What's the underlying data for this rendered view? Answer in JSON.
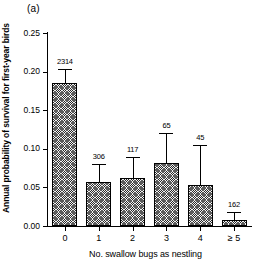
{
  "figure": {
    "panel_label": "(a)",
    "background_color": "#ffffff",
    "bar_fill_color": "#f2f2f2",
    "line_color": "#000000"
  },
  "chart_data": {
    "type": "bar",
    "title": "(a)",
    "xlabel": "No. swallow bugs as nestling",
    "ylabel": "Annual probability of survival for first-year birds",
    "categories": [
      "0",
      "1",
      "2",
      "3",
      "4",
      "≥ 5"
    ],
    "values": [
      0.185,
      0.057,
      0.062,
      0.082,
      0.053,
      0.008
    ],
    "errors_upper": [
      0.204,
      0.08,
      0.089,
      0.12,
      0.105,
      0.018
    ],
    "point_labels": [
      "2314",
      "306",
      "117",
      "65",
      "45",
      "162"
    ],
    "ylim": [
      0.0,
      0.25
    ],
    "ytick_labels": [
      "0.00",
      "0.05",
      "0.10",
      "0.15",
      "0.20",
      "0.25"
    ],
    "ytick_values": [
      0.0,
      0.05,
      0.1,
      0.15,
      0.2,
      0.25
    ],
    "grid": false,
    "legend": null
  }
}
